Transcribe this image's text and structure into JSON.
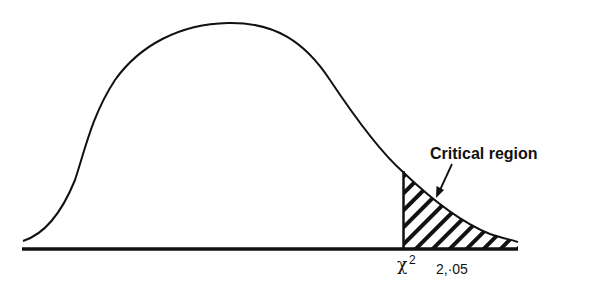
{
  "diagram": {
    "annotation_label": "Critical region",
    "critical_value": {
      "symbol": "χ",
      "superscript": "2",
      "subscript": "2,·05"
    },
    "distribution": {
      "name": "chi-square",
      "alpha": 0.05,
      "shaded_tail": "right"
    },
    "colors": {
      "ink": "#111111",
      "background": "#ffffff"
    }
  }
}
